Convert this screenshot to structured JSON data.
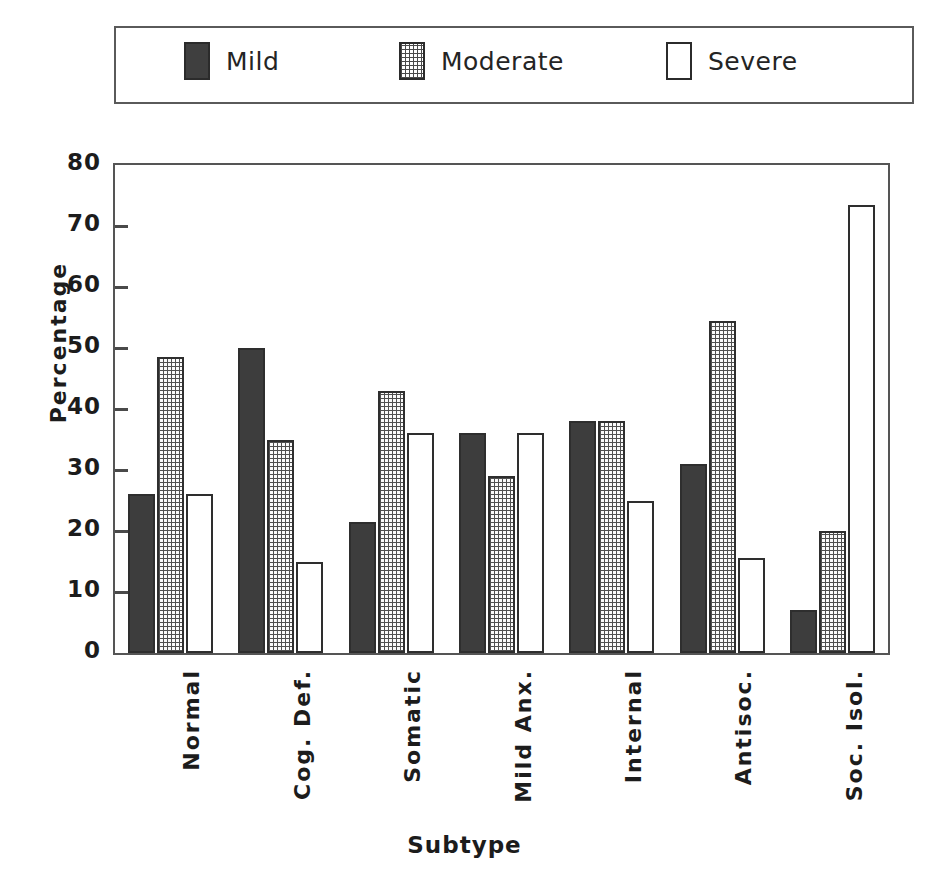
{
  "chart_data": {
    "type": "bar",
    "title": "",
    "xlabel": "Subtype",
    "ylabel": "Percentage",
    "ylim": [
      0,
      80
    ],
    "yticks": [
      "0",
      "10",
      "20",
      "30",
      "40",
      "50",
      "60",
      "70",
      "80"
    ],
    "grid": false,
    "legend_position": "top",
    "categories": [
      "Normal",
      "Cog. Def.",
      "Somatic",
      "Mild Anx.",
      "Internal",
      "Antisoc.",
      "Soc. Isol."
    ],
    "series": [
      {
        "name": "Mild",
        "swatch": "solid-dark",
        "color": "#3d3d3d",
        "values": [
          26,
          50,
          21.5,
          36,
          38,
          31,
          7
        ]
      },
      {
        "name": "Moderate",
        "swatch": "stippled",
        "color": "#fafafa",
        "values": [
          48.5,
          35,
          43,
          29,
          38,
          54.5,
          20
        ]
      },
      {
        "name": "Severe",
        "swatch": "open-white",
        "color": "#ffffff",
        "values": [
          26,
          15,
          36,
          36,
          25,
          15.5,
          73.5
        ]
      }
    ]
  },
  "legend": {
    "items": [
      {
        "label": "Mild",
        "style": "mild"
      },
      {
        "label": "Moderate",
        "style": "moderate"
      },
      {
        "label": "Severe",
        "style": "severe"
      }
    ]
  },
  "axes": {
    "y_title": "Percentage",
    "x_title": "Subtype"
  }
}
